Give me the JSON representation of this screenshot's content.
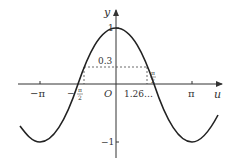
{
  "diagram": {
    "function": "y = cos u",
    "axes": {
      "x_label": "u",
      "y_label": "y",
      "origin_label": "O"
    },
    "x_ticks": [
      {
        "label": "−π",
        "value": -3.14159
      },
      {
        "label": "−π/2",
        "value": -1.5708
      },
      {
        "label": "π/2",
        "value": 1.5708
      },
      {
        "label": "π",
        "value": 3.14159
      }
    ],
    "y_ticks": [
      {
        "label": "1",
        "value": 1
      },
      {
        "label": "−1",
        "value": -1
      }
    ],
    "annotations": {
      "level_label": "0.3",
      "level_value": 0.3,
      "intersection_label": "1.26…",
      "intersection_value": 1.266
    },
    "colors": {
      "curve": "#222222",
      "axis": "#333333",
      "dashed": "#444444"
    }
  }
}
